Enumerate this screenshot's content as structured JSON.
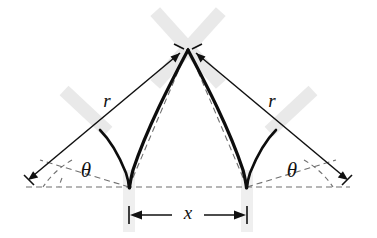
{
  "figure": {
    "title": "Pointed (gothic) arch geometry diagram",
    "background_color": "#ffffff",
    "ink_color": "#111111",
    "band_color": "#e9e9e9",
    "dash_color": "#6f6f6f",
    "labels": {
      "radius_left": "r",
      "radius_right": "r",
      "angle_left": "θ",
      "angle_right": "θ",
      "span": "x"
    },
    "geometry": {
      "apex": {
        "x": 188,
        "y": 48
      },
      "base_left": {
        "x": 129,
        "y": 187
      },
      "base_right": {
        "x": 247,
        "y": 187
      },
      "baseline_y": 187,
      "baseline_x_start": 26,
      "baseline_x_end": 350,
      "arrow_tip_left": {
        "x": 28,
        "y": 178
      },
      "arrow_tip_right": {
        "x": 348,
        "y": 178
      },
      "span_dimension_y": 215,
      "radius_label_left": {
        "x": 107,
        "y": 103
      },
      "radius_label_right": {
        "x": 272,
        "y": 103
      },
      "angle_label_left": {
        "x": 86,
        "y": 172
      },
      "angle_label_right": {
        "x": 292,
        "y": 172
      },
      "span_label": {
        "x": 188,
        "y": 214
      }
    }
  }
}
